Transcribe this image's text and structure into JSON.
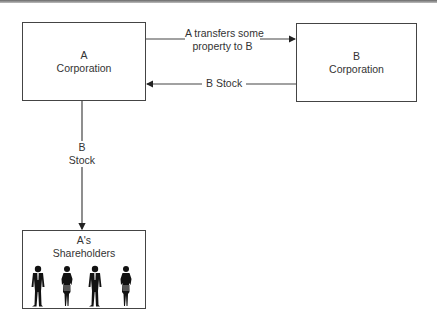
{
  "diagram": {
    "nodes": {
      "a_corp": {
        "line1": "A",
        "line2": "Corporation"
      },
      "b_corp": {
        "line1": "B",
        "line2": "Corporation"
      },
      "shareholders": {
        "line1": "A's",
        "line2": "Shareholders",
        "figures": [
          "man",
          "woman",
          "man",
          "woman"
        ]
      }
    },
    "edges": {
      "a_to_b": {
        "line1": "A transfers some",
        "line2": "property to B"
      },
      "b_to_a": {
        "label": "B Stock"
      },
      "a_to_shareholders": {
        "line1": "B",
        "line2": "Stock"
      }
    },
    "colors": {
      "line": "#444444",
      "text": "#333333",
      "figure": "#111111"
    }
  }
}
